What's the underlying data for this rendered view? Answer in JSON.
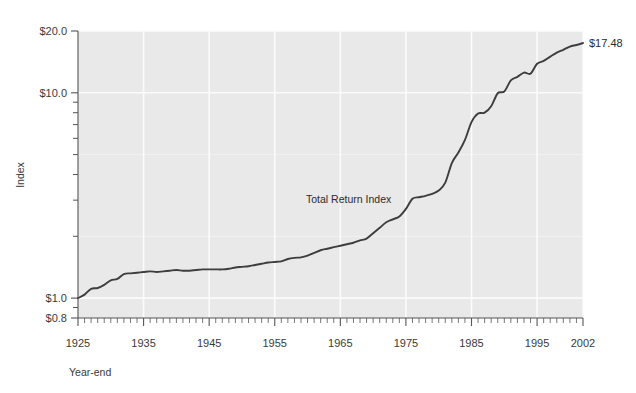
{
  "chart_data": {
    "type": "line",
    "title": "",
    "xlabel": "Year-end",
    "ylabel": "Index",
    "yscale": "log",
    "ylim": [
      0.8,
      20.0
    ],
    "xlim": [
      1925,
      2002
    ],
    "grid": true,
    "legend_position": "inline-annotation",
    "y_tick_labels": [
      "$20.0",
      "$10.0",
      "$1.0",
      "$0.8"
    ],
    "y_tick_values": [
      20.0,
      10.0,
      1.0,
      0.8
    ],
    "x_tick_labels": [
      "1925",
      "1935",
      "1945",
      "1955",
      "1965",
      "1975",
      "1985",
      "1995",
      "2002"
    ],
    "x_tick_values": [
      1925,
      1935,
      1945,
      1955,
      1965,
      1975,
      1985,
      1995,
      2002
    ],
    "annotations": [
      {
        "text": "Total Return Index",
        "x": 1966,
        "y": 2.95
      },
      {
        "text": "$17.48",
        "x": 2002,
        "y": 17.48
      }
    ],
    "series": [
      {
        "name": "Total Return Index",
        "color": "#3d3d3d",
        "x": [
          1925,
          1926,
          1927,
          1928,
          1929,
          1930,
          1931,
          1932,
          1933,
          1934,
          1935,
          1936,
          1937,
          1938,
          1939,
          1940,
          1941,
          1942,
          1943,
          1944,
          1945,
          1946,
          1947,
          1948,
          1949,
          1950,
          1951,
          1952,
          1953,
          1954,
          1955,
          1956,
          1957,
          1958,
          1959,
          1960,
          1961,
          1962,
          1963,
          1964,
          1965,
          1966,
          1967,
          1968,
          1969,
          1970,
          1971,
          1972,
          1973,
          1974,
          1975,
          1976,
          1977,
          1978,
          1979,
          1980,
          1981,
          1982,
          1983,
          1984,
          1985,
          1986,
          1987,
          1988,
          1989,
          1990,
          1991,
          1992,
          1993,
          1994,
          1995,
          1996,
          1997,
          1998,
          1999,
          2000,
          2001,
          2002
        ],
        "values": [
          1.0,
          1.04,
          1.11,
          1.12,
          1.16,
          1.22,
          1.24,
          1.31,
          1.32,
          1.33,
          1.34,
          1.35,
          1.34,
          1.35,
          1.36,
          1.37,
          1.36,
          1.36,
          1.37,
          1.38,
          1.38,
          1.38,
          1.38,
          1.39,
          1.41,
          1.42,
          1.43,
          1.45,
          1.47,
          1.49,
          1.5,
          1.51,
          1.55,
          1.57,
          1.58,
          1.61,
          1.66,
          1.71,
          1.74,
          1.77,
          1.8,
          1.83,
          1.86,
          1.91,
          1.95,
          2.07,
          2.2,
          2.34,
          2.42,
          2.5,
          2.72,
          3.05,
          3.1,
          3.15,
          3.22,
          3.34,
          3.65,
          4.55,
          5.12,
          5.9,
          7.2,
          7.92,
          8.0,
          8.6,
          9.95,
          10.15,
          11.5,
          11.95,
          12.55,
          12.4,
          13.85,
          14.3,
          15.0,
          15.7,
          16.2,
          16.8,
          17.1,
          17.48
        ]
      }
    ]
  },
  "axes": {
    "y_label": "Index",
    "x_label": "Year-end"
  },
  "colors": {
    "plot_background": "#e9e9e9",
    "gridline": "#fbfbfb",
    "axis": "#555555",
    "line": "#3d3d3d",
    "text": "#333333",
    "page_background": "#ffffff"
  }
}
